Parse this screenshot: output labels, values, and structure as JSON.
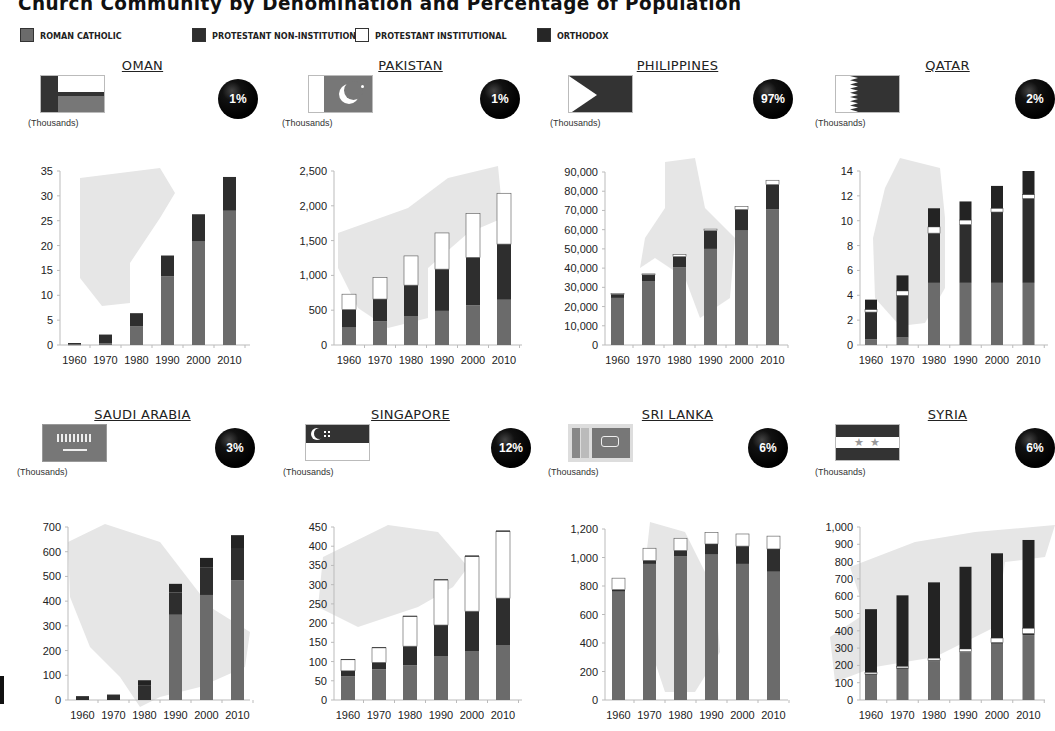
{
  "page": {
    "title": "Church Community by Denomination and Percentage of Population",
    "unit_label": "(Thousands)"
  },
  "legend": [
    {
      "label": "ROMAN CATHOLIC",
      "color": "#6b6b6b"
    },
    {
      "label": "PROTESTANT NON-INSTITUTIONAL",
      "color": "#2e2e2e"
    },
    {
      "label": "PROTESTANT INSTITUTIONAL",
      "color": "#ffffff"
    },
    {
      "label": "ORTHODOX",
      "color": "#262626"
    }
  ],
  "colors": {
    "roman_catholic": "#6b6b6b",
    "protestant_non_institutional": "#2e2e2e",
    "protestant_institutional": "#ffffff",
    "orthodox": "#232323",
    "map_silhouette": "#e6e6e6",
    "badge": "#000000"
  },
  "panels": [
    {
      "country": "OMAN",
      "percent": "1%",
      "flag": "oman-flag"
    },
    {
      "country": "PAKISTAN",
      "percent": "1%",
      "flag": "pakistan-flag"
    },
    {
      "country": "PHILIPPINES",
      "percent": "97%",
      "flag": "philippines-flag"
    },
    {
      "country": "QATAR",
      "percent": "2%",
      "flag": "qatar-flag"
    },
    {
      "country": "SAUDI ARABIA",
      "percent": "3%",
      "flag": "saudi-arabia-flag"
    },
    {
      "country": "SINGAPORE",
      "percent": "12%",
      "flag": "singapore-flag"
    },
    {
      "country": "SRI LANKA",
      "percent": "6%",
      "flag": "sri-lanka-flag"
    },
    {
      "country": "SYRIA",
      "percent": "6%",
      "flag": "syria-flag"
    }
  ],
  "chart_data": [
    {
      "type": "bar",
      "stacked": true,
      "title": "OMAN",
      "ylabel": "(Thousands)",
      "categories": [
        "1960",
        "1970",
        "1980",
        "1990",
        "2000",
        "2010"
      ],
      "ylim": [
        0,
        35
      ],
      "yticks": [
        0,
        5,
        10,
        15,
        20,
        25,
        30,
        35
      ],
      "ytick_labels": [
        "0",
        "5",
        "10",
        "15",
        "20",
        "25",
        "30",
        "35"
      ],
      "series": [
        {
          "name": "Roman Catholic",
          "values": [
            0.1,
            0.3,
            3.8,
            13.8,
            20.8,
            27
          ]
        },
        {
          "name": "Protestant Non-Institutional",
          "values": [
            0.3,
            1.8,
            2.6,
            4.2,
            5.5,
            6.8
          ]
        },
        {
          "name": "Protestant Institutional",
          "values": [
            0,
            0,
            0,
            0,
            0,
            0
          ]
        },
        {
          "name": "Orthodox",
          "values": [
            0,
            0,
            0,
            0,
            0,
            0
          ]
        }
      ],
      "percent_of_population": "1%"
    },
    {
      "type": "bar",
      "stacked": true,
      "title": "PAKISTAN",
      "ylabel": "(Thousands)",
      "categories": [
        "1960",
        "1970",
        "1980",
        "1990",
        "2000",
        "2010"
      ],
      "ylim": [
        0,
        2500
      ],
      "yticks": [
        0,
        500,
        1000,
        1500,
        2000,
        2500
      ],
      "ytick_labels": [
        "0",
        "500",
        "1,000",
        "1,500",
        "2,000",
        "2,500"
      ],
      "series": [
        {
          "name": "Roman Catholic",
          "values": [
            250,
            340,
            410,
            490,
            570,
            650
          ]
        },
        {
          "name": "Protestant Non-Institutional",
          "values": [
            260,
            320,
            450,
            600,
            690,
            800
          ]
        },
        {
          "name": "Protestant Institutional",
          "values": [
            220,
            310,
            420,
            520,
            630,
            730
          ]
        },
        {
          "name": "Orthodox",
          "values": [
            0,
            0,
            0,
            0,
            0,
            0
          ]
        }
      ],
      "percent_of_population": "1%"
    },
    {
      "type": "bar",
      "stacked": true,
      "title": "PHILIPPINES",
      "ylabel": "(Thousands)",
      "categories": [
        "1960",
        "1970",
        "1980",
        "1990",
        "2000",
        "2010"
      ],
      "ylim": [
        0,
        90000
      ],
      "yticks": [
        0,
        10000,
        20000,
        30000,
        40000,
        50000,
        60000,
        70000,
        80000,
        90000
      ],
      "ytick_labels": [
        "0",
        "10,000",
        "20,000",
        "30,000",
        "40,000",
        "50,000",
        "60,000",
        "70,000",
        "80,000",
        "90,000"
      ],
      "series": [
        {
          "name": "Roman Catholic",
          "values": [
            24500,
            33000,
            40500,
            50000,
            59500,
            70500
          ]
        },
        {
          "name": "Protestant Non-Institutional",
          "values": [
            2000,
            3500,
            5500,
            9500,
            11000,
            13000
          ]
        },
        {
          "name": "Protestant Institutional",
          "values": [
            300,
            500,
            1000,
            800,
            1600,
            2200
          ]
        },
        {
          "name": "Orthodox",
          "values": [
            0,
            0,
            0,
            0,
            0,
            0
          ]
        }
      ],
      "percent_of_population": "97%"
    },
    {
      "type": "bar",
      "stacked": true,
      "title": "QATAR",
      "ylabel": "(Thousands)",
      "categories": [
        "1960",
        "1970",
        "1980",
        "1990",
        "2000",
        "2010"
      ],
      "ylim": [
        0,
        14
      ],
      "yticks": [
        0,
        2,
        4,
        6,
        8,
        10,
        12,
        14
      ],
      "ytick_labels": [
        "0",
        "2",
        "4",
        "6",
        "8",
        "10",
        "12",
        "14"
      ],
      "series": [
        {
          "name": "Roman Catholic",
          "values": [
            0.45,
            0.6,
            5,
            5,
            5,
            5
          ]
        },
        {
          "name": "Protestant Non-Institutional",
          "values": [
            2.2,
            3.4,
            4,
            4.7,
            5.7,
            6.8
          ]
        },
        {
          "name": "Protestant Institutional",
          "values": [
            0.2,
            0.35,
            0.5,
            0.35,
            0.3,
            0.3
          ]
        },
        {
          "name": "Orthodox",
          "values": [
            0.8,
            1.25,
            1.5,
            1.5,
            1.8,
            1.9
          ]
        }
      ],
      "percent_of_population": "2%"
    },
    {
      "type": "bar",
      "stacked": true,
      "title": "SAUDI ARABIA",
      "ylabel": "(Thousands)",
      "categories": [
        "1960",
        "1970",
        "1980",
        "1990",
        "2000",
        "2010"
      ],
      "ylim": [
        0,
        700
      ],
      "yticks": [
        0,
        100,
        200,
        300,
        400,
        500,
        600,
        700
      ],
      "ytick_labels": [
        "0",
        "100",
        "200",
        "300",
        "400",
        "500",
        "600",
        "700"
      ],
      "series": [
        {
          "name": "Roman Catholic",
          "values": [
            0,
            0,
            0,
            345,
            425,
            485
          ]
        },
        {
          "name": "Protestant Non-Institutional",
          "values": [
            14,
            20,
            60,
            90,
            110,
            130
          ]
        },
        {
          "name": "Protestant Institutional",
          "values": [
            0,
            0,
            0,
            0,
            0,
            0
          ]
        },
        {
          "name": "Orthodox",
          "values": [
            1,
            2,
            20,
            35,
            40,
            52
          ]
        }
      ],
      "percent_of_population": "3%"
    },
    {
      "type": "bar",
      "stacked": true,
      "title": "SINGAPORE",
      "ylabel": "(Thousands)",
      "categories": [
        "1960",
        "1970",
        "1980",
        "1990",
        "2000",
        "2010"
      ],
      "ylim": [
        0,
        450
      ],
      "yticks": [
        0,
        50,
        100,
        150,
        200,
        250,
        300,
        350,
        400,
        450
      ],
      "ytick_labels": [
        "0",
        "50",
        "100",
        "150",
        "200",
        "250",
        "300",
        "350",
        "400",
        "450"
      ],
      "series": [
        {
          "name": "Roman Catholic",
          "values": [
            62,
            80,
            90,
            113,
            126,
            143
          ]
        },
        {
          "name": "Protestant Non-Institutional",
          "values": [
            14,
            18,
            50,
            82,
            105,
            122
          ]
        },
        {
          "name": "Protestant Institutional",
          "values": [
            29,
            38,
            78,
            117,
            142,
            173
          ]
        },
        {
          "name": "Orthodox",
          "values": [
            1,
            1,
            1,
            2,
            3,
            3
          ]
        }
      ],
      "percent_of_population": "12%"
    },
    {
      "type": "bar",
      "stacked": true,
      "title": "SRI LANKA",
      "ylabel": "(Thousands)",
      "categories": [
        "1960",
        "1970",
        "1980",
        "1990",
        "2000",
        "2010"
      ],
      "ylim": [
        0,
        1200
      ],
      "yticks": [
        0,
        200,
        400,
        600,
        800,
        1000,
        1200
      ],
      "ytick_labels": [
        "0",
        "200",
        "400",
        "600",
        "800",
        "1,000",
        "1,200"
      ],
      "series": [
        {
          "name": "Roman Catholic",
          "values": [
            760,
            955,
            1010,
            1020,
            955,
            900
          ]
        },
        {
          "name": "Protestant Non-Institutional",
          "values": [
            15,
            25,
            40,
            75,
            125,
            160
          ]
        },
        {
          "name": "Protestant Institutional",
          "values": [
            80,
            85,
            85,
            80,
            85,
            90
          ]
        },
        {
          "name": "Orthodox",
          "values": [
            0,
            0,
            0,
            0,
            0,
            0
          ]
        }
      ],
      "percent_of_population": "6%"
    },
    {
      "type": "bar",
      "stacked": true,
      "title": "SYRIA",
      "ylabel": "(Thousands)",
      "categories": [
        "1960",
        "1970",
        "1980",
        "1990",
        "2000",
        "2010"
      ],
      "ylim": [
        0,
        1000
      ],
      "yticks": [
        0,
        100,
        200,
        300,
        400,
        500,
        600,
        700,
        800,
        900,
        1000
      ],
      "ytick_labels": [
        "0",
        "100",
        "200",
        "300",
        "400",
        "500",
        "600",
        "700",
        "800",
        "900",
        "1,000"
      ],
      "series": [
        {
          "name": "Roman Catholic",
          "values": [
            145,
            180,
            225,
            275,
            325,
            375
          ]
        },
        {
          "name": "Protestant Non-Institutional",
          "values": [
            5,
            5,
            5,
            5,
            8,
            10
          ]
        },
        {
          "name": "Protestant Institutional",
          "values": [
            10,
            10,
            12,
            15,
            25,
            30
          ]
        },
        {
          "name": "Orthodox",
          "values": [
            365,
            410,
            438,
            475,
            490,
            510
          ]
        }
      ],
      "percent_of_population": "6%"
    }
  ]
}
